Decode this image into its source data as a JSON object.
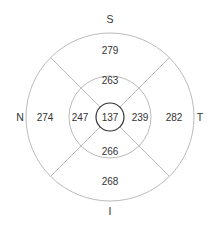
{
  "diagram": {
    "type": "etdrs-thickness-map",
    "colors": {
      "ring": "#bbbbbb",
      "center_ring": "#333333",
      "text": "#333333"
    },
    "orientation_labels": {
      "superior": "S",
      "inferior": "I",
      "nasal": "N",
      "temporal": "T"
    },
    "center": {
      "value": "137"
    },
    "inner_ring": {
      "superior": "263",
      "nasal": "247",
      "temporal": "239",
      "inferior": "266"
    },
    "outer_ring": {
      "superior": "279",
      "nasal": "274",
      "temporal": "282",
      "inferior": "268"
    }
  }
}
